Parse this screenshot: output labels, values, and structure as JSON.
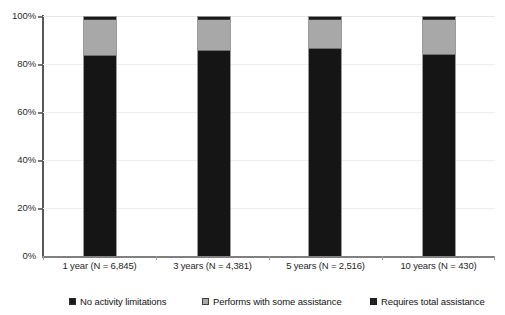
{
  "chart_data": {
    "type": "bar",
    "title": "",
    "subtitle": "",
    "xlabel": "",
    "ylabel": "",
    "stacked": true,
    "grid": true,
    "legend_position": "bottom",
    "ylim": [
      0,
      100
    ],
    "yticks": [
      0,
      20,
      40,
      60,
      80,
      100
    ],
    "ytick_labels": [
      "0%",
      "20%",
      "40%",
      "60%",
      "80%",
      "100%"
    ],
    "categories": [
      "1 year (N = 6,845)",
      "3 years (N = 4,381)",
      "5 years (N = 2,516)",
      "10 years (N = 430)"
    ],
    "series": [
      {
        "name": "No activity limitations",
        "color": "#151515",
        "values": [
          83.5,
          85.3,
          86.2,
          83.8
        ]
      },
      {
        "name": "Performs with some assistance",
        "color": "#a8a8a8",
        "values": [
          14.8,
          13.0,
          12.1,
          14.5
        ]
      },
      {
        "name": "Requires total assistance",
        "color": "#1a1a1a",
        "values": [
          1.7,
          1.7,
          1.7,
          1.7
        ]
      }
    ]
  },
  "axis": {
    "y_labels": [
      "100%",
      "80%",
      "60%",
      "40%",
      "20%",
      "0%"
    ],
    "x_labels": [
      "1 year (N = 6,845)",
      "3 years (N = 4,381)",
      "5 years (N = 2,516)",
      "10 years (N = 430)"
    ]
  },
  "legend": {
    "items": [
      {
        "label": "No activity limitations",
        "color": "#151515"
      },
      {
        "label": "Performs with some assistance",
        "color": "#a8a8a8"
      },
      {
        "label": "Requires total assistance",
        "color": "#1a1a1a"
      }
    ]
  }
}
